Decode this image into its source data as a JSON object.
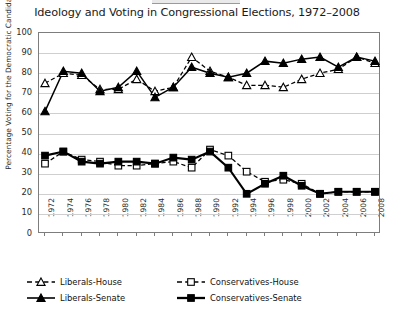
{
  "figure": {
    "title": "Ideology and Voting in Congressional Elections, 1972–2008",
    "accent": "#000000",
    "grid_color": "#cfcfcf",
    "frame_color": "#7d7d7d"
  },
  "legend": {
    "items": [
      {
        "label": "Liberals-House",
        "marker": "open-triangle-up",
        "line": "dashed",
        "weight": "thin"
      },
      {
        "label": "Conservatives-House",
        "marker": "open-square",
        "line": "dashed",
        "weight": "thin"
      },
      {
        "label": "Liberals-Senate",
        "marker": "filled-triangle-up",
        "line": "solid",
        "weight": "thin"
      },
      {
        "label": "Conservatives-Senate",
        "marker": "filled-square",
        "line": "solid",
        "weight": "thick"
      }
    ]
  },
  "chart_data": {
    "type": "line",
    "title": "Ideology and Voting in Congressional Elections, 1972–2008",
    "xlabel": "",
    "ylabel": "Percentage Voting for the Democratic Candidate",
    "ylim": [
      0,
      100
    ],
    "yticks": [
      0,
      10,
      20,
      30,
      40,
      50,
      60,
      70,
      80,
      90,
      100
    ],
    "grid": true,
    "legend_position": "below",
    "x": [
      1972,
      1974,
      1976,
      1978,
      1980,
      1982,
      1984,
      1986,
      1988,
      1990,
      1992,
      1994,
      1996,
      1998,
      2000,
      2002,
      2004,
      2006,
      2008
    ],
    "categories": [
      "1972",
      "1974",
      "1976",
      "1978",
      "1980",
      "1982",
      "1984",
      "1986",
      "1988",
      "1990",
      "1992",
      "1994",
      "1996",
      "1998",
      "2000",
      "2002",
      "2004",
      "2006",
      "2008"
    ],
    "series": [
      {
        "name": "Liberals-House",
        "marker": "open-triangle-up",
        "linestyle": "dashed",
        "values": [
          75,
          80,
          79,
          72,
          72,
          77,
          71,
          73,
          88,
          81,
          78,
          74,
          74,
          73,
          77,
          80,
          82,
          88,
          85
        ]
      },
      {
        "name": "Liberals-Senate",
        "marker": "filled-triangle-up",
        "linestyle": "solid",
        "values": [
          61,
          81,
          80,
          71,
          73,
          81,
          68,
          73,
          83,
          80,
          78,
          80,
          86,
          85,
          87,
          88,
          83,
          88,
          86
        ]
      },
      {
        "name": "Conservatives-House",
        "marker": "open-square",
        "linestyle": "dashed",
        "values": [
          35,
          41,
          37,
          36,
          34,
          34,
          35,
          36,
          33,
          42,
          39,
          31,
          26,
          27,
          25,
          20,
          21,
          21,
          21
        ]
      },
      {
        "name": "Conservatives-Senate",
        "marker": "filled-square",
        "linestyle": "solid",
        "values": [
          39,
          41,
          36,
          35,
          36,
          36,
          35,
          38,
          37,
          41,
          33,
          20,
          25,
          29,
          24,
          20,
          21,
          21,
          21
        ]
      }
    ]
  }
}
